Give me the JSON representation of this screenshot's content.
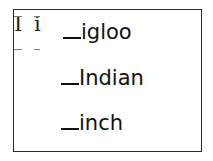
{
  "letters": {
    "upper": "I",
    "lower": "i"
  },
  "words": [
    {
      "blank": "_",
      "text": "igloo"
    },
    {
      "blank": "_",
      "text": "Indian"
    },
    {
      "blank": "_",
      "text": "inch"
    }
  ]
}
